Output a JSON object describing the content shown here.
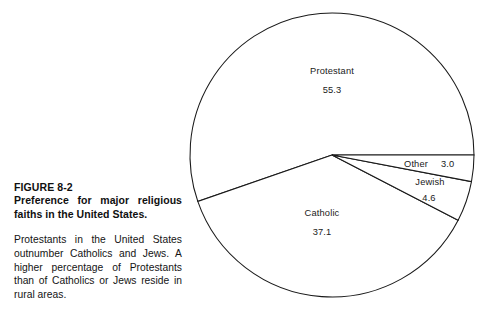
{
  "figure": {
    "number": "FIGURE 8-2",
    "title": "Preference for major religious faiths in the United States.",
    "body": "Protestants in the United States outnumber Catholics and Jews. A higher percentage of Protestants than of Catholics or Jews reside in rural areas."
  },
  "chart_data": {
    "type": "pie",
    "title": "Preference for major religious faiths in the United States.",
    "categories": [
      "Protestant",
      "Catholic",
      "Jewish",
      "Other"
    ],
    "values": [
      55.3,
      37.1,
      4.6,
      3.0
    ],
    "value_labels": [
      "55.3",
      "37.1",
      "4.6",
      "3.0"
    ],
    "unit": "percent",
    "legend": "none",
    "grid": false,
    "slice_fill": "#ffffff",
    "slice_stroke": "#1a1a1a",
    "start_angle_deg": 0,
    "direction": "counterclockwise",
    "center": [
      332,
      155
    ],
    "radius": 142,
    "labels": [
      {
        "name": "Protestant",
        "value": "55.3",
        "placement": "inside-top"
      },
      {
        "name": "Catholic",
        "value": "37.1",
        "placement": "inside-bottom-left"
      },
      {
        "name": "Jewish",
        "value": "4.6",
        "placement": "inside-right"
      },
      {
        "name": "Other",
        "value": "3.0",
        "placement": "inside-right-top"
      }
    ]
  },
  "pie_labels": {
    "protestant_name": "Protestant",
    "protestant_value": "55.3",
    "catholic_name": "Catholic",
    "catholic_value": "37.1",
    "jewish_name": "Jewish",
    "jewish_value": "4.6",
    "other_name": "Other",
    "other_value": "3.0"
  }
}
